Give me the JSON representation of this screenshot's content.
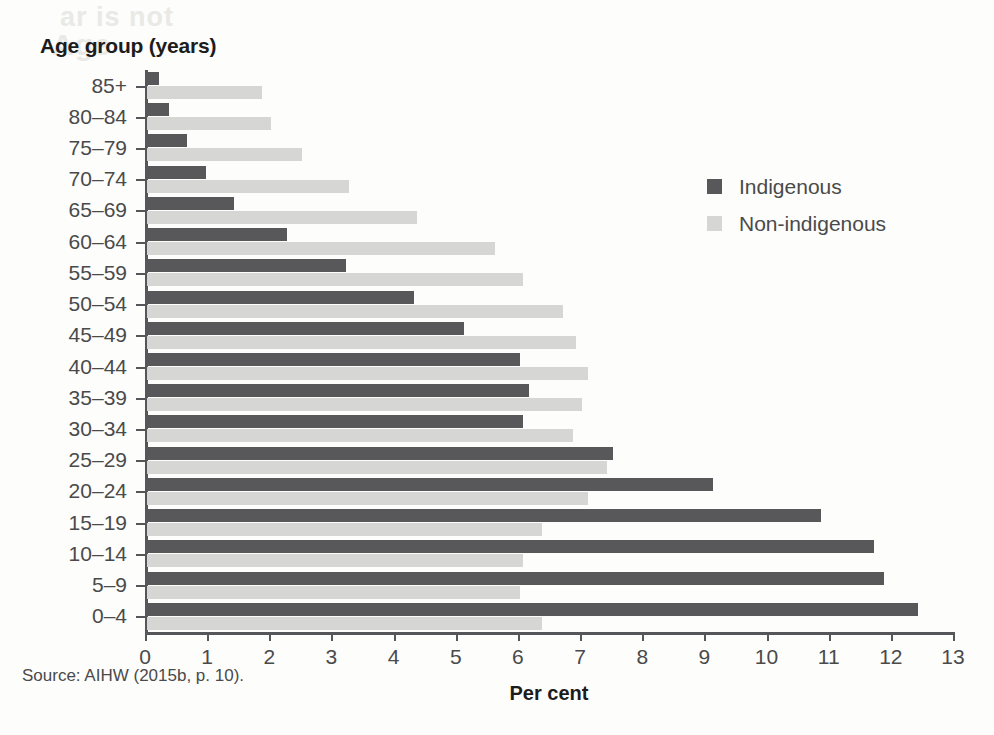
{
  "chart_data": {
    "type": "bar",
    "orientation": "horizontal",
    "title": "Age group (years)",
    "xlabel": "Per cent",
    "ylabel": "Age group (years)",
    "xlim": [
      0,
      13
    ],
    "xticks": [
      0,
      1,
      2,
      3,
      4,
      5,
      6,
      7,
      8,
      9,
      10,
      11,
      12,
      13
    ],
    "grid": false,
    "legend_position": "right",
    "categories": [
      "85+",
      "80–84",
      "75–79",
      "70–74",
      "65–69",
      "60–64",
      "55–59",
      "50–54",
      "45–49",
      "40–44",
      "35–39",
      "30–34",
      "25–29",
      "20–24",
      "15–19",
      "10–14",
      "5–9",
      "0–4"
    ],
    "series": [
      {
        "name": "Indigenous",
        "color": "#58585a",
        "values": [
          0.2,
          0.35,
          0.65,
          0.95,
          1.4,
          2.25,
          3.2,
          4.3,
          5.1,
          6.0,
          6.15,
          6.05,
          7.5,
          9.1,
          10.85,
          11.7,
          11.85,
          12.4
        ]
      },
      {
        "name": "Non-indigenous",
        "color": "#d6d6d4",
        "values": [
          1.85,
          2.0,
          2.5,
          3.25,
          4.35,
          5.6,
          6.05,
          6.7,
          6.9,
          7.1,
          7.0,
          6.85,
          7.4,
          7.1,
          6.35,
          6.05,
          6.0,
          6.35
        ]
      }
    ],
    "source_note": "Source: AIHW (2015b, p. 10)."
  },
  "ghost_text": {
    "line1": "ar is not",
    "line2": "Age"
  }
}
